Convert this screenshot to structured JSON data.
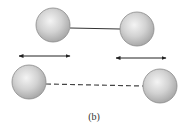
{
  "figure": {
    "caption": "(b)",
    "colors": {
      "sphere_fill_light": "#f4f4f4",
      "sphere_fill_dark": "#a9a9a9",
      "sphere_stroke": "#8a8a8a",
      "bond": "#333333",
      "arrow": "#222222"
    },
    "top_pair": {
      "bond_style": "solid",
      "spheres": [
        {
          "cx": 53,
          "cy": 25,
          "r": 17
        },
        {
          "cx": 137,
          "cy": 29,
          "r": 17
        }
      ]
    },
    "arrows": [
      {
        "x1": 19,
        "x2": 70,
        "y": 56,
        "type": "double-headed"
      },
      {
        "x1": 116,
        "x2": 166,
        "y": 58,
        "type": "double-headed"
      }
    ],
    "bottom_pair": {
      "bond_style": "dashed",
      "spheres": [
        {
          "cx": 29,
          "cy": 82,
          "r": 17
        },
        {
          "cx": 160,
          "cy": 86,
          "r": 17
        }
      ]
    }
  }
}
